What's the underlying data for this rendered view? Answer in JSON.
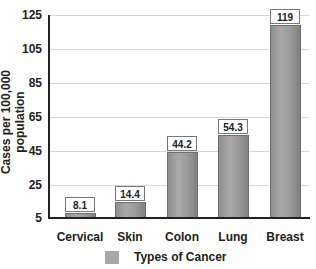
{
  "chart_data": {
    "type": "bar",
    "title": "",
    "xlabel": "",
    "ylabel": "Cases per 100,000 population",
    "ylim": [
      5,
      125
    ],
    "yticks": [
      "125",
      "105",
      "85",
      "65",
      "45",
      "25",
      "5"
    ],
    "categories": [
      "Cervical",
      "Skin",
      "Colon",
      "Lung",
      "Breast"
    ],
    "values": [
      8.1,
      14.4,
      44.2,
      54.3,
      119
    ],
    "value_labels": [
      "8.1",
      "14.4",
      "44.2",
      "54.3",
      "119"
    ],
    "legend": [
      "Types of Cancer"
    ],
    "legend_position": "bottom",
    "grid": true,
    "bar_color": "#a0a0a0"
  }
}
